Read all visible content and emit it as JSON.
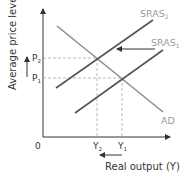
{
  "diagram": {
    "type": "economics-ad-as",
    "axes": {
      "y_label": "Average price level",
      "x_label": "Real output (Y)",
      "origin_label": "0"
    },
    "curves": [
      {
        "id": "sras2",
        "label": "SRAS",
        "subscript": "2",
        "color": "#555555"
      },
      {
        "id": "sras1",
        "label": "SRAS",
        "subscript": "1",
        "color": "#555555"
      },
      {
        "id": "ad",
        "label": "AD",
        "subscript": "",
        "color": "#8f8f8f"
      }
    ],
    "price_levels": [
      {
        "label": "P",
        "subscript": "2"
      },
      {
        "label": "P",
        "subscript": "1"
      }
    ],
    "outputs": [
      {
        "label": "Y",
        "subscript": "2"
      },
      {
        "label": "Y",
        "subscript": "1"
      }
    ],
    "annotations": {
      "shift_arrow": "SRAS shifts left from SRAS1 to SRAS2",
      "price_arrow": "price level rises",
      "output_arrow": "output falls"
    },
    "colors": {
      "axis": "#333333",
      "sras": "#555555",
      "ad": "#8f8f8f",
      "guide": "#aaaaaa",
      "label_light": "#9a9a9a"
    }
  }
}
